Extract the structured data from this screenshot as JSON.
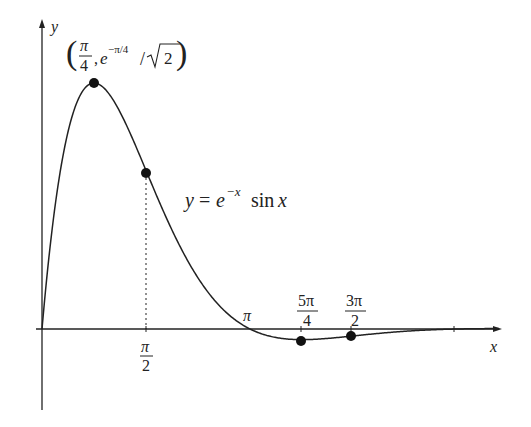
{
  "figure": {
    "function_label": {
      "lhs": "y",
      "eq": "=",
      "base": "e",
      "exponent": "−x",
      "trig": "sin",
      "arg": "x"
    },
    "axes": {
      "x_label": "x",
      "y_label": "y"
    },
    "peak_label": {
      "open": "(",
      "frac_num": "π",
      "frac_den": "4",
      "comma": ",",
      "base": "e",
      "exponent": "−π/4",
      "slash": "/",
      "sqrt_arg": "2",
      "close": ")"
    },
    "tick_labels": {
      "pi_over_2_num": "π",
      "pi_over_2_den": "2",
      "pi": "π",
      "five_pi_over_4_num": "5π",
      "five_pi_over_4_den": "4",
      "three_pi_over_2_num": "3π",
      "three_pi_over_2_den": "2"
    },
    "colors": {
      "ink": "#222222",
      "background": "#ffffff"
    }
  },
  "chart_data": {
    "type": "line",
    "title": "",
    "function": "y = e^(-x) sin x",
    "xlabel": "x",
    "ylabel": "y",
    "x_ticks": [
      "π/2",
      "π",
      "5π/4",
      "3π/2"
    ],
    "highlighted_points": [
      {
        "label": "(π/4, e^(−π/4)/√2)",
        "x": 0.785,
        "y": 0.322
      },
      {
        "label": "π/2",
        "x": 1.571,
        "y": 0.208
      },
      {
        "label": "5π/4",
        "x": 3.927,
        "y": -0.014
      },
      {
        "label": "3π/2",
        "x": 4.712,
        "y": -0.009
      }
    ],
    "zero_crossing": {
      "label": "π",
      "x": 3.1416,
      "y": 0
    },
    "xlim": [
      0,
      6.9
    ],
    "ylim": [
      -0.1,
      0.4
    ],
    "grid": false,
    "legend": "none"
  }
}
